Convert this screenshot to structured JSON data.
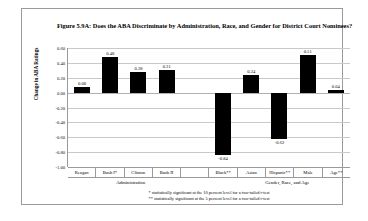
{
  "figure": {
    "title": "Figure 5.9A: Does the ABA Discriminate by Administration, Race, and Gender for District Court Nominees?",
    "ylabel": "Change in ABA Ratings",
    "group_labels": {
      "left": "Administration",
      "right": "Gender, Race, and Age"
    },
    "footnotes": [
      "* statistically significant at the 10 percent level for a two-tailed t-test",
      "** statistically significant at the 5 percent level for a two-tailed t-test"
    ],
    "bar_color": "#000000",
    "grid_color": "#c9c9c9"
  },
  "chart_data": {
    "type": "bar",
    "title": "Figure 5.9A: Does the ABA Discriminate by Administration, Race, and Gender for District Court Nominees?",
    "xlabel": "",
    "ylabel": "Change in ABA Ratings",
    "ylim": [
      -1.0,
      0.6
    ],
    "grid": true,
    "legend": "none",
    "yticks": [
      0.6,
      0.4,
      0.2,
      0.0,
      -0.2,
      -0.4,
      -0.6,
      -0.8,
      -1.0
    ],
    "ytick_labels": [
      "0.60",
      "0.40",
      "0.20",
      "0.00",
      "-0.20",
      "-0.40",
      "-0.60",
      "-0.80",
      "-1.00"
    ],
    "categories": [
      "Reagan",
      "Bush I*",
      "Clinton",
      "Bush II",
      "",
      "Black**",
      "Asian",
      "Hispanic**",
      "Male",
      "Age**"
    ],
    "values": [
      0.08,
      0.48,
      0.28,
      0.31,
      null,
      -0.84,
      0.24,
      -0.62,
      0.51,
      0.04
    ],
    "value_labels": [
      "0.08",
      "0.48",
      "0.28",
      "0.31",
      "",
      "-0.84",
      "0.24",
      "-0.62",
      "0.51",
      "0.04"
    ],
    "groups": [
      {
        "label": "Administration",
        "categories": [
          "Reagan",
          "Bush I*",
          "Clinton",
          "Bush II"
        ]
      },
      {
        "label": "Gender, Race, and Age",
        "categories": [
          "Black**",
          "Asian",
          "Hispanic**",
          "Male",
          "Age**"
        ]
      }
    ]
  }
}
